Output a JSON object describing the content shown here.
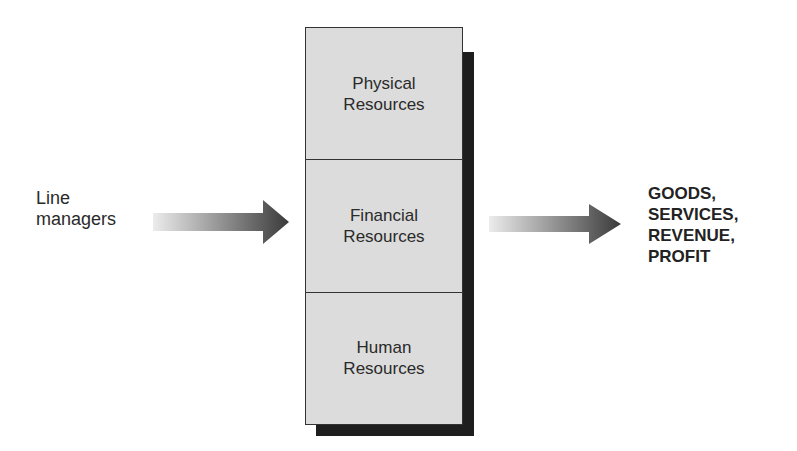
{
  "diagram": {
    "input": {
      "label": "Line\nmanagers"
    },
    "resources": [
      {
        "label": "Physical\nResources"
      },
      {
        "label": "Financial\nResources"
      },
      {
        "label": "Human\nResources"
      }
    ],
    "output": {
      "label": "GOODS,\nSERVICES,\nREVENUE,\nPROFIT"
    },
    "colors": {
      "box_fill": "#dcdcdc",
      "shadow": "#1e1e1e",
      "arrow_start": "#e6e6e6",
      "arrow_end": "#3a3a3a"
    }
  }
}
